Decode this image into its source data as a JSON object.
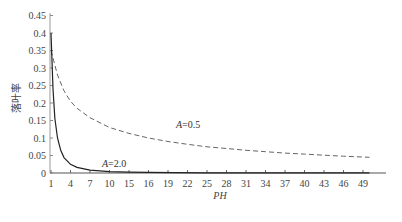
{
  "chart_data": {
    "type": "line",
    "title": "",
    "xlabel": "PH",
    "ylabel": "落叶率",
    "xlim": [
      1,
      51
    ],
    "ylim": [
      0,
      0.45
    ],
    "grid": false,
    "legend": "none (inline annotations)",
    "x_ticks": [
      "1",
      "4",
      "7",
      "10",
      "15",
      "16",
      "19",
      "22",
      "25",
      "28",
      "31",
      "34",
      "37",
      "40",
      "43",
      "46",
      "49"
    ],
    "y_ticks": [
      "0",
      "0.05",
      "0.1",
      "0.15",
      "0.2",
      "0.25",
      "0.3",
      "0.35",
      "0.4",
      "0.45"
    ],
    "series": [
      {
        "name": "A=0.5",
        "style": "dashed",
        "x": [
          1,
          2,
          3,
          4,
          5,
          7,
          10,
          13,
          16,
          19,
          22,
          25,
          28,
          31,
          34,
          37,
          40,
          43,
          46,
          50
        ],
        "values": [
          0.35,
          0.28,
          0.235,
          0.205,
          0.185,
          0.158,
          0.13,
          0.113,
          0.1,
          0.09,
          0.082,
          0.075,
          0.07,
          0.065,
          0.061,
          0.057,
          0.054,
          0.051,
          0.048,
          0.045
        ]
      },
      {
        "name": "A=2.0",
        "style": "solid",
        "x": [
          1,
          1.3,
          1.6,
          2,
          2.5,
          3,
          4,
          5,
          7,
          10,
          13,
          16,
          20,
          25,
          30,
          40,
          50
        ],
        "values": [
          0.4,
          0.24,
          0.155,
          0.1,
          0.064,
          0.044,
          0.025,
          0.016,
          0.008,
          0.004,
          0.0024,
          0.0016,
          0.001,
          0.0006,
          0.0004,
          0.0003,
          0.0002
        ]
      }
    ],
    "annotations": [
      {
        "text_prefix": "A",
        "text_suffix": "=0.5",
        "x": 21,
        "y": 0.125
      },
      {
        "text_prefix": "A",
        "text_suffix": "=2.0",
        "x": 13,
        "y": 0.018
      }
    ]
  },
  "labels": {
    "ylabel": "落叶率",
    "xlabel": "PH",
    "anno_05_a": "A",
    "anno_05_val": "=0.5",
    "anno_20_a": "A",
    "anno_20_val": "=2.0"
  }
}
